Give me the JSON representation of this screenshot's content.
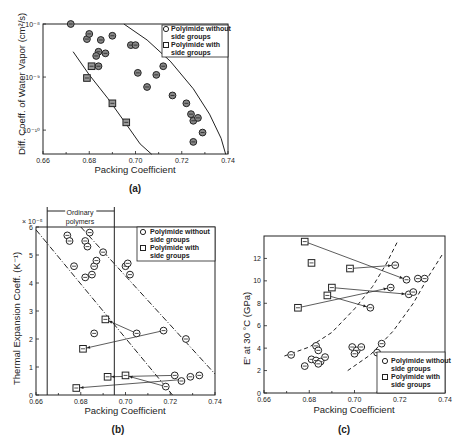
{
  "chart_data": [
    {
      "id": "a",
      "type": "scatter",
      "caption": "(a)",
      "title": "",
      "xlabel": "Packing Coefficient",
      "ylabel": "Diff. Coeff. of Water Vapor (cm²/s)",
      "xlim": [
        0.66,
        0.74
      ],
      "ylim_log10": [
        -10.45,
        -8
      ],
      "yscale": "log",
      "x_ticks": [
        "0.66",
        "0.68",
        "0.70",
        "0.72",
        "0.74"
      ],
      "y_ticks": [
        "10⁻⁸",
        "10⁻⁹",
        "10⁻¹⁰"
      ],
      "legend": [
        "Polyimide without side groups",
        "Polyimide with side groups"
      ],
      "legend_position": "upper right",
      "series": [
        {
          "name": "Polyimide without side groups",
          "marker": "circle",
          "points": [
            [
              0.672,
              1e-08
            ],
            [
              0.679,
              5.2e-09
            ],
            [
              0.68,
              6.5e-09
            ],
            [
              0.685,
              5e-09
            ],
            [
              0.69,
              6e-09
            ],
            [
              0.684,
              3e-09
            ],
            [
              0.687,
              2.8e-09
            ],
            [
              0.683,
              2.5e-09
            ],
            [
              0.684,
              1.6e-09
            ],
            [
              0.698,
              4e-09
            ],
            [
              0.7,
              4e-09
            ],
            [
              0.701,
              1.2e-09
            ],
            [
              0.705,
              6.5e-10
            ],
            [
              0.709,
              1.1e-09
            ],
            [
              0.712,
              1.6e-09
            ],
            [
              0.716,
              4.5e-10
            ],
            [
              0.722,
              3.2e-10
            ],
            [
              0.724,
              2e-10
            ],
            [
              0.725,
              1.5e-10
            ],
            [
              0.727,
              1.7e-10
            ],
            [
              0.729,
              9e-11
            ],
            [
              0.725,
              6e-11
            ]
          ]
        },
        {
          "name": "Polyimide with side groups",
          "marker": "square",
          "points": [
            [
              0.681,
              1.6e-09
            ],
            [
              0.679,
              9.6e-10
            ],
            [
              0.69,
              3.2e-10
            ],
            [
              0.696,
              1.4e-10
            ]
          ]
        }
      ],
      "curves": [
        {
          "style": "solid",
          "points": [
            [
              0.673,
              3e-09
            ],
            [
              0.68,
              1.1e-09
            ],
            [
              0.688,
              4e-10
            ],
            [
              0.696,
              1.3e-10
            ],
            [
              0.702,
              5.5e-11
            ],
            [
              0.707,
              3.5e-11
            ]
          ]
        },
        {
          "style": "solid",
          "points": [
            [
              0.695,
              1e-08
            ],
            [
              0.705,
              5e-09
            ],
            [
              0.715,
              2e-09
            ],
            [
              0.725,
              6e-10
            ],
            [
              0.732,
              2e-10
            ],
            [
              0.737,
              7e-11
            ],
            [
              0.739,
              3.5e-11
            ]
          ]
        }
      ]
    },
    {
      "id": "b",
      "type": "scatter",
      "caption": "(b)",
      "title": "",
      "xlabel": "Packing Coefficient",
      "ylabel": "Thermal Expansion Coeff. (K⁻¹)",
      "y_multiplier": "× 10⁻⁵",
      "xlim": [
        0.66,
        0.74
      ],
      "ylim": [
        0,
        6
      ],
      "x_ticks": [
        "0.66",
        "0.68",
        "0.70",
        "0.72",
        "0.74"
      ],
      "y_ticks": [
        "0",
        "1",
        "2",
        "3",
        "4",
        "5",
        "6"
      ],
      "annotation": "Ordinary polymers",
      "ordinary_range": [
        0.665,
        0.695
      ],
      "legend": [
        "Polyimide without side groups",
        "Polyimide with side groups"
      ],
      "legend_position": "upper right",
      "series": [
        {
          "name": "Polyimide without side groups",
          "marker": "circle",
          "points": [
            [
              0.674,
              5.7
            ],
            [
              0.675,
              5.5
            ],
            [
              0.682,
              5.5
            ],
            [
              0.683,
              5.3
            ],
            [
              0.684,
              5.8
            ],
            [
              0.69,
              5.1
            ],
            [
              0.677,
              4.6
            ],
            [
              0.682,
              4.2
            ],
            [
              0.685,
              4.3
            ],
            [
              0.686,
              4.6
            ],
            [
              0.687,
              4.8
            ],
            [
              0.7,
              4.6
            ],
            [
              0.701,
              4.7
            ],
            [
              0.702,
              4.3
            ],
            [
              0.686,
              2.2
            ],
            [
              0.705,
              2.2
            ],
            [
              0.717,
              2.3
            ],
            [
              0.727,
              2.0
            ],
            [
              0.722,
              0.7
            ],
            [
              0.725,
              0.5
            ],
            [
              0.729,
              0.65
            ],
            [
              0.733,
              0.7
            ],
            [
              0.718,
              0.3
            ]
          ]
        },
        {
          "name": "Polyimide with side groups",
          "marker": "square",
          "points": [
            [
              0.691,
              2.7
            ],
            [
              0.681,
              1.65
            ],
            [
              0.692,
              0.65
            ],
            [
              0.7,
              0.7
            ],
            [
              0.678,
              0.25
            ]
          ]
        }
      ],
      "connections": [
        [
          [
            0.691,
            2.7
          ],
          [
            0.705,
            2.2
          ]
        ],
        [
          [
            0.681,
            1.65
          ],
          [
            0.717,
            2.3
          ]
        ],
        [
          [
            0.692,
            0.65
          ],
          [
            0.722,
            0.7
          ]
        ],
        [
          [
            0.7,
            0.7
          ],
          [
            0.718,
            0.3
          ]
        ],
        [
          [
            0.678,
            0.25
          ],
          [
            0.725,
            0.55
          ]
        ]
      ],
      "lines": [
        {
          "style": "dashdot",
          "points": [
            [
              0.66,
              5.9
            ],
            [
              0.721,
              0.0
            ]
          ]
        },
        {
          "style": "dashdot",
          "points": [
            [
              0.68,
              6.0
            ],
            [
              0.74,
              0.75
            ]
          ]
        }
      ]
    },
    {
      "id": "c",
      "type": "scatter",
      "caption": "(c)",
      "title": "",
      "xlabel": "Packing Coefficient",
      "ylabel": "E' at 30 °C (GPa)",
      "xlim": [
        0.66,
        0.74
      ],
      "ylim": [
        0,
        14
      ],
      "x_ticks": [
        "0.66",
        "0.68",
        "0.70",
        "0.72",
        "0.74"
      ],
      "y_ticks": [
        "0",
        "2",
        "4",
        "6",
        "8",
        "10",
        "12"
      ],
      "legend": [
        "Polyimide without side groups",
        "Polyimide with side groups"
      ],
      "legend_position": "lower right",
      "series": [
        {
          "name": "Polyimide without side groups",
          "marker": "circle",
          "points": [
            [
              0.672,
              3.4
            ],
            [
              0.678,
              2.4
            ],
            [
              0.681,
              3.0
            ],
            [
              0.683,
              4.2
            ],
            [
              0.684,
              3.8
            ],
            [
              0.683,
              2.9
            ],
            [
              0.685,
              2.8
            ],
            [
              0.684,
              2.6
            ],
            [
              0.687,
              3.2
            ],
            [
              0.699,
              4.1
            ],
            [
              0.701,
              3.8
            ],
            [
              0.7,
              3.5
            ],
            [
              0.703,
              4.1
            ],
            [
              0.712,
              4.4
            ],
            [
              0.71,
              3.6
            ],
            [
              0.707,
              7.6
            ],
            [
              0.716,
              9.4
            ],
            [
              0.718,
              11.4
            ],
            [
              0.723,
              10.1
            ],
            [
              0.724,
              8.8
            ],
            [
              0.726,
              9.0
            ],
            [
              0.728,
              10.2
            ],
            [
              0.731,
              10.2
            ]
          ]
        },
        {
          "name": "Polyimide with side groups",
          "marker": "square",
          "points": [
            [
              0.678,
              13.5
            ],
            [
              0.681,
              11.6
            ],
            [
              0.698,
              11.1
            ],
            [
              0.69,
              9.4
            ],
            [
              0.688,
              8.7
            ],
            [
              0.675,
              7.6
            ]
          ]
        }
      ],
      "connections": [
        [
          [
            0.723,
            10.1
          ],
          [
            0.678,
            13.5
          ]
        ],
        [
          [
            0.718,
            11.4
          ],
          [
            0.698,
            11.1
          ]
        ],
        [
          [
            0.724,
            8.8
          ],
          [
            0.69,
            9.4
          ]
        ],
        [
          [
            0.707,
            7.6
          ],
          [
            0.688,
            8.7
          ]
        ],
        [
          [
            0.716,
            9.4
          ],
          [
            0.675,
            7.6
          ]
        ]
      ],
      "curves": [
        {
          "style": "dashed",
          "points": [
            [
              0.669,
              3.3
            ],
            [
              0.68,
              4.1
            ],
            [
              0.69,
              5.4
            ],
            [
              0.7,
              7.5
            ],
            [
              0.708,
              9.5
            ],
            [
              0.714,
              11.5
            ],
            [
              0.719,
              13.5
            ]
          ]
        },
        {
          "style": "dashed",
          "points": [
            [
              0.697,
              2.0
            ],
            [
              0.707,
              3.4
            ],
            [
              0.717,
              5.5
            ],
            [
              0.726,
              8.0
            ],
            [
              0.733,
              10.5
            ],
            [
              0.739,
              12.4
            ]
          ]
        }
      ]
    }
  ],
  "figure_labels": {
    "a": {
      "caption": "(a)",
      "xlabel": "Packing Coefficient",
      "ylabel": "Diff. Coeff. of Water Vapor (cm²/s)",
      "legend1": "Polyimide without",
      "legend1b": "side groups",
      "legend2": "Polyimide with",
      "legend2b": "side groups"
    },
    "b": {
      "caption": "(b)",
      "xlabel": "Packing Coefficient",
      "ylabel": "Thermal Expansion Coeff. (K⁻¹)",
      "mult": "× 10⁻⁵",
      "annot1": "Ordinary",
      "annot2": "polymers",
      "legend1": "Polyimide without",
      "legend1b": "side groups",
      "legend2": "Polyimide with",
      "legend2b": "side groups"
    },
    "c": {
      "caption": "(c)",
      "xlabel": "Packing Coefficient",
      "ylabel": "E' at 30 °C (GPa)",
      "legend1": "Polyimide without",
      "legend1b": "side groups",
      "legend2": "Polyimide with",
      "legend2b": "side groups"
    }
  }
}
